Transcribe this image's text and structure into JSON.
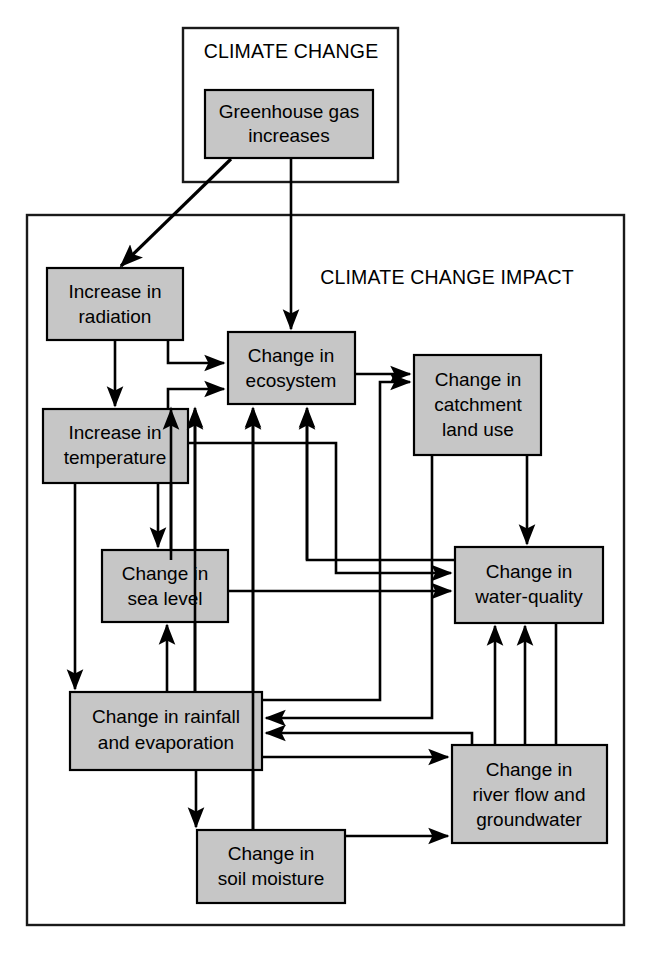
{
  "figure": {
    "type": "flowchart",
    "background_color": "#ffffff",
    "node_fill": "#c6c6c6",
    "node_stroke": "#000000",
    "line_color": "#000000"
  },
  "groups": [
    {
      "id": "climate-change",
      "label": "CLIMATE CHANGE",
      "x": 183,
      "y": 28,
      "w": 215,
      "h": 154,
      "label_x": 291,
      "label_y": 52
    },
    {
      "id": "climate-change-impact",
      "label": "CLIMATE CHANGE IMPACT",
      "x": 27,
      "y": 215,
      "w": 597,
      "h": 710,
      "label_x": 447,
      "label_y": 277
    }
  ],
  "nodes": [
    {
      "id": "greenhouse-gas",
      "label": "Greenhouse gas increases",
      "lines": [
        "Greenhouse gas",
        "increases"
      ],
      "x": 205,
      "y": 90,
      "w": 168,
      "h": 68
    },
    {
      "id": "increase-radiation",
      "label": "Increase in radiation",
      "lines": [
        "Increase in",
        "radiation"
      ],
      "x": 47,
      "y": 268,
      "w": 136,
      "h": 72
    },
    {
      "id": "increase-temperature",
      "label": "Increase in temperature",
      "lines": [
        "Increase in",
        "temperature"
      ],
      "x": 43,
      "y": 409,
      "w": 145,
      "h": 74
    },
    {
      "id": "change-ecosystem",
      "label": "Change in ecosystem",
      "lines": [
        "Change in",
        "ecosystem"
      ],
      "x": 228,
      "y": 332,
      "w": 127,
      "h": 72
    },
    {
      "id": "change-catchment-land-use",
      "label": "Change in catchment land use",
      "lines": [
        "Change in",
        "catchment",
        "land use"
      ],
      "x": 414,
      "y": 355,
      "w": 127,
      "h": 100
    },
    {
      "id": "change-sea-level",
      "label": "Change in sea level",
      "lines": [
        "Change in",
        "sea level"
      ],
      "x": 102,
      "y": 550,
      "w": 126,
      "h": 72
    },
    {
      "id": "change-water-quality",
      "label": "Change in water-quality",
      "lines": [
        "Change in",
        "water-quality"
      ],
      "x": 455,
      "y": 547,
      "w": 148,
      "h": 76
    },
    {
      "id": "change-rainfall-evaporation",
      "label": "Change in rainfall and evaporation",
      "lines": [
        "Change in rainfall",
        "and evaporation"
      ],
      "x": 70,
      "y": 692,
      "w": 192,
      "h": 78
    },
    {
      "id": "change-river-flow-groundwater",
      "label": "Change in river flow and groundwater",
      "lines": [
        "Change in",
        "river flow and",
        "groundwater"
      ],
      "x": 452,
      "y": 745,
      "w": 155,
      "h": 98
    },
    {
      "id": "change-soil-moisture",
      "label": "Change in soil moisture",
      "lines": [
        "Change in",
        "soil moisture"
      ],
      "x": 197,
      "y": 830,
      "w": 148,
      "h": 73
    }
  ],
  "edges": [
    {
      "id": "greenhouse-to-radiation",
      "from": "greenhouse-gas",
      "to": "increase-radiation",
      "arrow": true
    },
    {
      "id": "greenhouse-to-ecosystem",
      "from": "greenhouse-gas",
      "to": "change-ecosystem",
      "arrow": true
    },
    {
      "id": "radiation-to-temperature",
      "from": "increase-radiation",
      "to": "increase-temperature",
      "arrow": true
    },
    {
      "id": "radiation-to-ecosystem",
      "from": "increase-radiation",
      "to": "change-ecosystem",
      "arrow": true
    },
    {
      "id": "temperature-to-ecosystem",
      "from": "increase-temperature",
      "to": "change-ecosystem",
      "arrow": true
    },
    {
      "id": "temperature-to-sea-level",
      "from": "increase-temperature",
      "to": "change-sea-level",
      "arrow": true
    },
    {
      "id": "temperature-to-rainfall",
      "from": "increase-temperature",
      "to": "change-rainfall-evaporation",
      "arrow": true
    },
    {
      "id": "temperature-to-water-quality",
      "from": "increase-temperature",
      "to": "change-water-quality",
      "arrow": true
    },
    {
      "id": "ecosystem-to-catchment",
      "from": "change-ecosystem",
      "to": "change-catchment-land-use",
      "arrow": true
    },
    {
      "id": "catchment-to-water-quality",
      "from": "change-catchment-land-use",
      "to": "change-water-quality",
      "arrow": true
    },
    {
      "id": "catchment-to-rainfall",
      "from": "change-catchment-land-use",
      "to": "change-rainfall-evaporation",
      "arrow": true
    },
    {
      "id": "sea-level-to-ecosystem",
      "from": "change-sea-level",
      "to": "change-ecosystem",
      "arrow": true
    },
    {
      "id": "sea-level-to-water-quality",
      "from": "change-sea-level",
      "to": "change-water-quality",
      "arrow": true
    },
    {
      "id": "rainfall-to-ecosystem",
      "from": "change-rainfall-evaporation",
      "to": "change-ecosystem",
      "arrow": true
    },
    {
      "id": "rainfall-to-sea-level",
      "from": "change-rainfall-evaporation",
      "to": "change-sea-level",
      "arrow": true
    },
    {
      "id": "rainfall-to-soil-moisture",
      "from": "change-rainfall-evaporation",
      "to": "change-soil-moisture",
      "arrow": true
    },
    {
      "id": "rainfall-to-river-flow",
      "from": "change-rainfall-evaporation",
      "to": "change-river-flow-groundwater",
      "arrow": true
    },
    {
      "id": "rainfall-to-catchment",
      "from": "change-rainfall-evaporation",
      "to": "change-catchment-land-use",
      "arrow": true
    },
    {
      "id": "soil-moisture-to-ecosystem",
      "from": "change-soil-moisture",
      "to": "change-ecosystem",
      "arrow": true
    },
    {
      "id": "soil-moisture-to-river-flow",
      "from": "change-soil-moisture",
      "to": "change-river-flow-groundwater",
      "arrow": true
    },
    {
      "id": "river-flow-to-water-quality",
      "from": "change-river-flow-groundwater",
      "to": "change-water-quality",
      "arrow": true
    },
    {
      "id": "river-flow-to-rainfall",
      "from": "change-river-flow-groundwater",
      "to": "change-rainfall-evaporation",
      "arrow": true
    },
    {
      "id": "water-quality-to-ecosystem",
      "from": "change-water-quality",
      "to": "change-ecosystem",
      "arrow": true
    }
  ]
}
